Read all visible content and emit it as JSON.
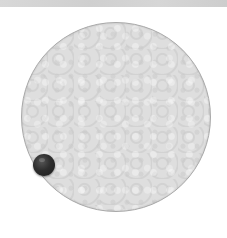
{
  "game": {
    "arena": {
      "shape": "circle",
      "fill_color": "#dcdcdc",
      "border_color": "#a9a9a9",
      "pattern": "textured-light-gray"
    },
    "player_ball": {
      "color": "#2a2a2a",
      "position": "left-lower-edge"
    },
    "top_strip": {
      "color": "#d4d4d4"
    }
  }
}
